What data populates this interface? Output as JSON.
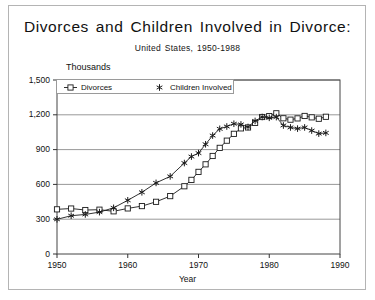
{
  "figure": {
    "title": "Divorces and Children Involved in Divorce:",
    "subtitle": "United States, 1950-1988",
    "background_color": "#ffffff",
    "frame_color": "#b4b4b4"
  },
  "axes": {
    "y_unit_label": "Thousands",
    "x_axis_title": "Year",
    "y_ticks": [
      "0",
      "300",
      "600",
      "900",
      "1,200",
      "1,500"
    ],
    "x_ticks": [
      "1950",
      "1960",
      "1970",
      "1980",
      "1990"
    ]
  },
  "legend": {
    "items": [
      {
        "label": "Divorces",
        "marker": "square-marker",
        "color": "#222222"
      },
      {
        "label": "Children Involved",
        "marker": "star-marker",
        "color": "#222222"
      }
    ]
  },
  "chart_data": {
    "type": "line",
    "title": "Divorces and Children Involved in Divorce:",
    "subtitle": "United States, 1950-1988",
    "xlabel": "Year",
    "ylabel": "Thousands",
    "xlim": [
      1950,
      1990
    ],
    "ylim": [
      0,
      1500
    ],
    "xticks": [
      1950,
      1960,
      1970,
      1980,
      1990
    ],
    "yticks": [
      0,
      300,
      600,
      900,
      1200,
      1500
    ],
    "grid": "horizontal",
    "legend_position": "top-inside",
    "x": [
      1950,
      1952,
      1954,
      1956,
      1958,
      1960,
      1962,
      1964,
      1966,
      1968,
      1969,
      1970,
      1971,
      1972,
      1973,
      1974,
      1975,
      1976,
      1977,
      1978,
      1979,
      1980,
      1981,
      1982,
      1983,
      1984,
      1985,
      1986,
      1987,
      1988
    ],
    "series": [
      {
        "name": "Divorces",
        "marker": "square-marker",
        "values": [
          385,
          392,
          379,
          382,
          368,
          393,
          413,
          450,
          499,
          584,
          639,
          708,
          773,
          845,
          915,
          977,
          1036,
          1083,
          1091,
          1130,
          1181,
          1189,
          1213,
          1170,
          1158,
          1169,
          1190,
          1178,
          1166,
          1183
        ]
      },
      {
        "name": "Children Involved",
        "marker": "star-marker",
        "values": [
          299,
          330,
          341,
          361,
          398,
          463,
          532,
          613,
          669,
          784,
          840,
          870,
          946,
          1021,
          1079,
          1099,
          1123,
          1117,
          1095,
          1147,
          1181,
          1174,
          1180,
          1108,
          1091,
          1081,
          1091,
          1064,
          1038,
          1044
        ]
      }
    ]
  }
}
